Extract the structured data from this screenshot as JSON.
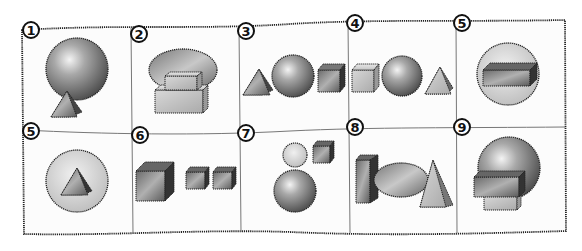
{
  "figure": {
    "panels": [
      {
        "label": "1",
        "shapes": [
          "sphere",
          "triangular-prism"
        ]
      },
      {
        "label": "2",
        "shapes": [
          "ellipse-disc",
          "rectangular-prism",
          "rectangular-prism"
        ]
      },
      {
        "label": "3",
        "shapes": [
          "triangular-prism",
          "sphere",
          "cube"
        ]
      },
      {
        "label": "4",
        "shapes": [
          "cube",
          "sphere",
          "triangular-prism"
        ]
      },
      {
        "label": "5",
        "shapes": [
          "circle-disc",
          "rectangular-prism"
        ]
      },
      {
        "label": "5",
        "shapes": [
          "circle-disc",
          "triangular-prism"
        ]
      },
      {
        "label": "6",
        "shapes": [
          "cube",
          "cube",
          "cube"
        ]
      },
      {
        "label": "7",
        "shapes": [
          "sphere",
          "cube",
          "sphere"
        ]
      },
      {
        "label": "8",
        "shapes": [
          "rectangular-prism",
          "ellipse-disc",
          "triangular-prism"
        ]
      },
      {
        "label": "9",
        "shapes": [
          "sphere",
          "rectangular-prism",
          "rectangular-prism"
        ]
      }
    ]
  },
  "colors": {
    "frame": "#222222",
    "divider": "#777777",
    "shape_dark": "#555555",
    "shape_mid": "#999999",
    "shape_light": "#dddddd"
  }
}
